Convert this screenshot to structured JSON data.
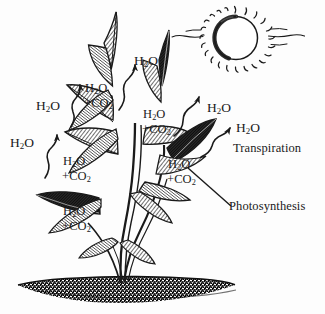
{
  "figure": {
    "style": "black and white pen-and-ink line drawing",
    "background_color": "#fdfdfd",
    "ink_color": "#1a1a1a",
    "width": 325,
    "height": 314
  },
  "formulas": {
    "water": "H",
    "water_sub": "2",
    "water_tail": "O",
    "combo_line1_a": "H",
    "combo_line1_sub": "2",
    "combo_line1_b": "O",
    "combo_line2_a": "+CO",
    "combo_line2_sub": "2"
  },
  "water_labels": [
    {
      "id": "h2o-upper-left",
      "text": "H2O",
      "x": 36,
      "y": 106,
      "arrow": "wavy-up-right"
    },
    {
      "id": "h2o-top-center",
      "text": "H2O",
      "x": 134,
      "y": 61,
      "arrow": "wavy-up-right"
    },
    {
      "id": "h2o-far-left",
      "text": "H2O",
      "x": 10,
      "y": 143,
      "arrow": "wavy-up-right"
    },
    {
      "id": "h2o-right-upper",
      "text": "H2O",
      "x": 207,
      "y": 108,
      "arrow": "wavy-up-right"
    },
    {
      "id": "h2o-right-lower",
      "text": "H2O",
      "x": 236,
      "y": 128,
      "arrow": "wavy-up-right"
    }
  ],
  "combo_labels": [
    {
      "id": "combo-upper-left",
      "line1": "H2O",
      "line2": "+CO2",
      "x": 85,
      "y": 88
    },
    {
      "id": "combo-center",
      "line1": "H2O",
      "line2": "+CO2",
      "x": 143,
      "y": 114
    },
    {
      "id": "combo-mid-left",
      "line1": "H2O",
      "line2": "+CO2",
      "x": 63,
      "y": 161
    },
    {
      "id": "combo-mid-right",
      "line1": "H2O",
      "line2": "+CO2",
      "x": 168,
      "y": 164
    },
    {
      "id": "combo-lower-left",
      "line1": "H2O",
      "line2": "+CO2",
      "x": 63,
      "y": 211
    }
  ],
  "process_labels": [
    {
      "id": "transpiration",
      "text": "Transpiration",
      "x": 233,
      "y": 148,
      "leader": "wavy-arrow-to-leaf"
    },
    {
      "id": "photosynthesis",
      "text": "Photosynthesis",
      "x": 229,
      "y": 206,
      "leader": "straight-line-to-leaf"
    }
  ],
  "scene_elements": [
    {
      "id": "sun",
      "name": "sun-with-rays",
      "cx": 235,
      "cy": 38,
      "r": 21,
      "ray_count": 30
    },
    {
      "id": "plant",
      "name": "plant-with-leaves",
      "leaf_count": 14,
      "stem_base_x": 120,
      "stem_base_y": 283
    },
    {
      "id": "soil",
      "name": "soil-ground",
      "cx": 122,
      "cy": 288,
      "width": 215,
      "height": 22
    }
  ]
}
